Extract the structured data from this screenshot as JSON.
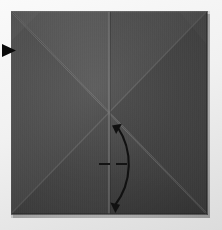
{
  "figure": {
    "title": "Origami step: valley-fold right half to the vertical center crease",
    "caption": "",
    "step_number": ""
  },
  "canvas": {
    "width": 222,
    "height": 230,
    "background_color": "#f1f1f1",
    "background_top_color": "#fafafa",
    "background_bottom_color": "#dcdcdc"
  },
  "paper": {
    "shape": "square",
    "left": 11,
    "top": 11,
    "width": 199,
    "height": 207,
    "base_color": "#4a4a4a",
    "quadrant_colors": {
      "top": "#4f4f4f",
      "left": "#474747",
      "right": "#434343",
      "bottom": "#3e3e3e"
    },
    "edge_highlight_color": "#6a6a6a",
    "shadow_color": "#2c2c2c",
    "texture": "vertical-laid-lines"
  },
  "creases": [
    {
      "name": "diagonal-crease-tl-br",
      "type": "diagonal",
      "from": "top-left",
      "to": "bottom-right",
      "color": "#6d6d6d"
    },
    {
      "name": "diagonal-crease-tr-bl",
      "type": "diagonal",
      "from": "top-right",
      "to": "bottom-left",
      "color": "#5c5c5c"
    },
    {
      "name": "vertical-center-crease",
      "type": "vertical",
      "from": "top-center",
      "to": "bottom-center",
      "color": "#6f6f6f"
    }
  ],
  "annotations": {
    "fold_arrow": {
      "name": "fold-unfold-arrow",
      "style": "double-headed-curved",
      "color": "#111111",
      "stroke_width": 2,
      "start_point": {
        "x": 117,
        "y": 126
      },
      "end_point": {
        "x": 114,
        "y": 207
      },
      "bulge_direction": "right",
      "meaning": "fold and unfold"
    },
    "reference_line": {
      "name": "dashed-reference-line",
      "style": "dashed",
      "color": "#141414",
      "x1": 99,
      "x2": 129,
      "y": 164,
      "dash_pattern": "11 6"
    },
    "side_pointer": {
      "name": "left-edge-pointer-triangle",
      "style": "solid-triangle",
      "color": "#0b0b0b",
      "direction": "right",
      "x": 2,
      "y": 44,
      "width": 14,
      "height": 12
    }
  },
  "legend": {
    "fold_arrow_label": "fold and unfold",
    "dashed_line_label": "crease reference",
    "pointer_label": "view direction"
  }
}
